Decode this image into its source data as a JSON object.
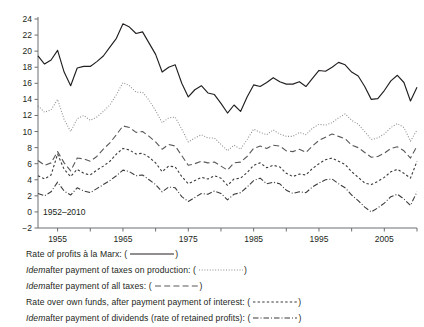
{
  "figure": {
    "annotation": "1952–2010",
    "bg_color": "#ffffff",
    "axis_color": "#6d6e71"
  },
  "legend": {
    "items": [
      {
        "name": "rate-of-profits-marx",
        "pre": "Rate of profits à la Marx: (",
        "italic_lead": "",
        "post": ")",
        "style": "solid",
        "color": "#231f20",
        "open": "(",
        "close": ")"
      },
      {
        "name": "after-taxes-on-production",
        "italic_lead": "Idem",
        "pre": " after payment of taxes on production: (",
        "post": ")",
        "style": "dotted",
        "color": "#8a8c8e",
        "open": "(",
        "close": ")"
      },
      {
        "name": "after-all-taxes",
        "italic_lead": "Idem",
        "pre": " after payment of all taxes: (",
        "post": ")",
        "style": "longdash",
        "color": "#58595b",
        "open": "(",
        "close": ")"
      },
      {
        "name": "rate-over-own-funds",
        "italic_lead": "",
        "pre": "Rate over own funds, after payment payment of interest: (",
        "post": ")",
        "style": "shortdash",
        "color": "#3b3b3d",
        "open": "(",
        "close": ")"
      },
      {
        "name": "after-dividends-retained",
        "italic_lead": "Idem",
        "pre": " after payment of dividends (rate of retained profits): (",
        "post": ")",
        "style": "dashdot",
        "color": "#3b3b3d",
        "open": "(",
        "close": ")"
      }
    ]
  },
  "chart_data": {
    "type": "line",
    "title": "",
    "xlabel": "",
    "ylabel": "",
    "annotation": "1952–2010",
    "grid": false,
    "legend_position": "below",
    "xlim": [
      1952,
      2010
    ],
    "ylim": [
      -2,
      24
    ],
    "yticks": [
      -2,
      0,
      2,
      4,
      6,
      8,
      10,
      12,
      14,
      16,
      18,
      20,
      22,
      24
    ],
    "xticks": [
      1955,
      1960,
      1965,
      1970,
      1975,
      1980,
      1985,
      1990,
      1995,
      2000,
      2005,
      2010
    ],
    "xtick_labels": [
      "1955",
      "",
      "1965",
      "",
      "1975",
      "",
      "1985",
      "",
      "1995",
      "",
      "2005",
      ""
    ],
    "x": [
      1952,
      1953,
      1954,
      1955,
      1956,
      1957,
      1958,
      1959,
      1960,
      1961,
      1962,
      1963,
      1964,
      1965,
      1966,
      1967,
      1968,
      1969,
      1970,
      1971,
      1972,
      1973,
      1974,
      1975,
      1976,
      1977,
      1978,
      1979,
      1980,
      1981,
      1982,
      1983,
      1984,
      1985,
      1986,
      1987,
      1988,
      1989,
      1990,
      1991,
      1992,
      1993,
      1994,
      1995,
      1996,
      1997,
      1998,
      1999,
      2000,
      2001,
      2002,
      2003,
      2004,
      2005,
      2006,
      2007,
      2008,
      2009,
      2010
    ],
    "series": [
      {
        "name": "Rate of profits à la Marx",
        "style": "solid",
        "color": "#231f20",
        "values": [
          19.4,
          18.4,
          18.9,
          20.1,
          17.4,
          15.7,
          17.9,
          18.1,
          18.1,
          18.7,
          19.4,
          20.5,
          21.6,
          23.4,
          23.0,
          22.2,
          22.4,
          21.0,
          19.6,
          17.4,
          18.0,
          18.3,
          16.0,
          14.3,
          15.2,
          15.7,
          14.8,
          14.6,
          13.5,
          12.3,
          13.3,
          12.5,
          14.3,
          15.8,
          15.6,
          16.1,
          16.7,
          16.2,
          15.9,
          15.9,
          16.2,
          15.6,
          16.6,
          17.6,
          17.5,
          18.0,
          18.6,
          18.3,
          17.4,
          16.9,
          15.6,
          14.0,
          14.1,
          15.1,
          16.3,
          17.0,
          16.1,
          13.8,
          15.5
        ]
      },
      {
        "name": "Idem after payment of taxes on production",
        "style": "dotted",
        "color": "#8a8c8e",
        "values": [
          13.2,
          12.4,
          12.7,
          14.0,
          11.5,
          10.0,
          11.6,
          12.0,
          11.4,
          11.8,
          12.5,
          13.3,
          14.6,
          16.1,
          15.7,
          14.9,
          14.9,
          13.9,
          12.6,
          11.1,
          11.7,
          11.8,
          10.3,
          8.7,
          9.2,
          9.6,
          9.2,
          9.2,
          8.4,
          7.6,
          8.3,
          7.8,
          9.0,
          10.3,
          9.9,
          9.6,
          10.2,
          9.7,
          9.4,
          9.4,
          9.9,
          9.6,
          10.4,
          10.9,
          10.8,
          11.1,
          11.7,
          12.2,
          11.4,
          10.9,
          10.0,
          9.0,
          9.2,
          9.7,
          10.5,
          11.0,
          10.5,
          8.8,
          10.2
        ]
      },
      {
        "name": "Idem after payment of all taxes",
        "style": "longdash",
        "color": "#58595b",
        "values": [
          6.4,
          5.8,
          6.1,
          7.5,
          6.1,
          5.1,
          6.7,
          6.6,
          6.3,
          6.9,
          7.8,
          8.6,
          9.6,
          10.7,
          10.5,
          9.9,
          10.0,
          9.4,
          8.7,
          7.8,
          8.4,
          8.2,
          7.0,
          5.8,
          6.0,
          6.3,
          6.1,
          6.2,
          5.7,
          5.2,
          6.1,
          6.2,
          6.9,
          7.9,
          8.2,
          7.9,
          8.3,
          8.2,
          7.6,
          7.5,
          7.8,
          7.4,
          8.2,
          8.9,
          9.3,
          9.7,
          9.4,
          9.1,
          8.3,
          8.0,
          7.4,
          6.8,
          6.9,
          7.3,
          7.9,
          8.1,
          7.6,
          6.7,
          8.2
        ]
      },
      {
        "name": "Rate over own funds, after payment payment of interest",
        "style": "shortdash",
        "color": "#3b3b3d",
        "values": [
          4.5,
          4.1,
          4.6,
          7.2,
          5.3,
          4.4,
          5.3,
          4.8,
          4.6,
          5.2,
          5.7,
          6.3,
          7.2,
          7.9,
          7.7,
          7.2,
          7.3,
          6.8,
          6.1,
          5.0,
          5.7,
          5.6,
          4.4,
          3.5,
          3.9,
          4.3,
          4.1,
          4.5,
          4.2,
          3.3,
          4.1,
          4.2,
          4.9,
          5.8,
          6.1,
          5.5,
          5.8,
          5.6,
          4.8,
          4.4,
          4.7,
          4.6,
          5.4,
          6.0,
          6.5,
          6.7,
          6.3,
          5.9,
          5.0,
          4.3,
          3.6,
          3.4,
          3.8,
          4.3,
          5.0,
          5.3,
          4.8,
          4.2,
          6.3
        ]
      },
      {
        "name": "Idem after payment of dividends (rate of retained profits)",
        "style": "dashdot",
        "color": "#3b3b3d",
        "values": [
          2.3,
          2.0,
          2.5,
          3.7,
          2.6,
          2.1,
          3.0,
          2.6,
          2.4,
          2.9,
          3.4,
          3.9,
          4.5,
          5.2,
          5.0,
          4.5,
          4.6,
          4.0,
          3.4,
          2.5,
          3.1,
          3.0,
          1.9,
          1.3,
          1.8,
          2.3,
          2.2,
          2.6,
          2.3,
          1.5,
          2.2,
          2.4,
          3.1,
          3.9,
          4.2,
          3.5,
          3.7,
          3.5,
          2.7,
          2.3,
          2.5,
          2.4,
          3.1,
          3.6,
          4.0,
          4.1,
          3.5,
          3.0,
          2.1,
          1.4,
          0.6,
          0.0,
          0.5,
          1.1,
          1.9,
          2.2,
          1.6,
          0.8,
          2.5
        ]
      }
    ]
  }
}
